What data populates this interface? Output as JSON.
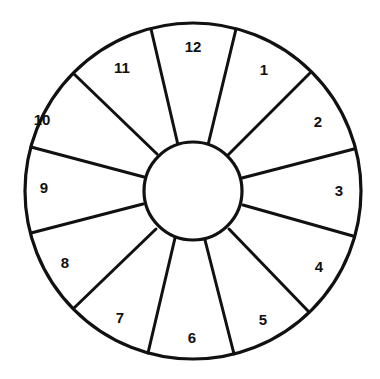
{
  "diagram": {
    "type": "circular-segment-wheel",
    "colors": {
      "stroke": "#111111",
      "background": "#ffffff"
    },
    "geometry": {
      "center": [
        193,
        191
      ],
      "outer_radius": 168,
      "inner_radius": 49
    },
    "center_circle": {
      "label": ""
    },
    "segments": [
      {
        "label": "12",
        "pos": [
          193,
          46
        ]
      },
      {
        "label": "1",
        "pos": [
          264,
          69
        ]
      },
      {
        "label": "2",
        "pos": [
          318,
          121
        ]
      },
      {
        "label": "3",
        "pos": [
          339,
          190
        ]
      },
      {
        "label": "4",
        "pos": [
          319,
          266
        ]
      },
      {
        "label": "5",
        "pos": [
          263,
          319
        ]
      },
      {
        "label": "6",
        "pos": [
          192,
          337
        ]
      },
      {
        "label": "7",
        "pos": [
          120,
          317
        ]
      },
      {
        "label": "8",
        "pos": [
          65,
          262
        ]
      },
      {
        "label": "9",
        "pos": [
          44,
          187
        ]
      },
      {
        "label": "10",
        "pos": [
          42,
          119
        ]
      },
      {
        "label": "11",
        "pos": [
          122,
          67
        ]
      }
    ],
    "spokes": [
      {
        "between": "11-12",
        "inner": [
          178,
          145
        ],
        "outer": [
          151,
          29
        ]
      },
      {
        "between": "12-1",
        "inner": [
          208,
          145
        ],
        "outer": [
          236,
          29
        ]
      },
      {
        "between": "1-2",
        "inner": [
          228,
          155
        ],
        "outer": [
          310,
          73
        ]
      },
      {
        "between": "2-3",
        "inner": [
          242,
          178
        ],
        "outer": [
          354,
          149
        ]
      },
      {
        "between": "3-4",
        "inner": [
          243,
          205
        ],
        "outer": [
          353,
          236
        ]
      },
      {
        "between": "4-5",
        "inner": [
          229,
          229
        ],
        "outer": [
          309,
          312
        ]
      },
      {
        "between": "5-6",
        "inner": [
          205,
          240
        ],
        "outer": [
          234,
          354
        ]
      },
      {
        "between": "6-7",
        "inner": [
          175,
          238
        ],
        "outer": [
          148,
          353
        ]
      },
      {
        "between": "7-8",
        "inner": [
          156,
          229
        ],
        "outer": [
          74,
          308
        ]
      },
      {
        "between": "8-9",
        "inner": [
          143,
          204
        ],
        "outer": [
          31,
          233
        ]
      },
      {
        "between": "9-10",
        "inner": [
          144,
          177
        ],
        "outer": [
          31,
          147
        ]
      },
      {
        "between": "10-11",
        "inner": [
          157,
          154
        ],
        "outer": [
          74,
          74
        ]
      }
    ]
  }
}
